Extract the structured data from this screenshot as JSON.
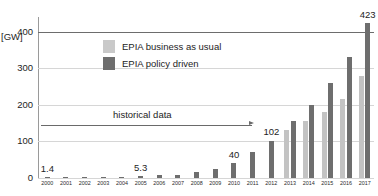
{
  "chart_data": {
    "type": "bar",
    "title": "",
    "xlabel": "",
    "ylabel": "[GW]",
    "ylim": [
      0,
      440
    ],
    "yticks": [
      0,
      100,
      200,
      300,
      400
    ],
    "grid": true,
    "legend_position": "inside-top-left",
    "categories": [
      "2000",
      "2001",
      "2002",
      "2003",
      "2004",
      "2005",
      "2006",
      "2007",
      "2008",
      "2009",
      "2010",
      "2011",
      "2012",
      "2013",
      "2014",
      "2015",
      "2016",
      "2017"
    ],
    "series": [
      {
        "name": "EPIA business as usual",
        "color": "#c3c3c3",
        "values": [
          null,
          null,
          null,
          null,
          null,
          null,
          null,
          null,
          null,
          null,
          null,
          null,
          null,
          130,
          155,
          180,
          215,
          280
        ]
      },
      {
        "name": "EPIA policy driven",
        "color": "#6e6e6e",
        "values": [
          1.4,
          1.8,
          2.2,
          2.8,
          3.9,
          5.3,
          7.0,
          9.5,
          16,
          24,
          40,
          70,
          102,
          155,
          200,
          260,
          330,
          423
        ]
      }
    ],
    "data_labels": [
      {
        "text": "1.4",
        "category": "2000"
      },
      {
        "text": "5.3",
        "category": "2005"
      },
      {
        "text": "40",
        "category": "2010"
      },
      {
        "text": "102",
        "category": "2012"
      },
      {
        "text": "423",
        "category": "2017"
      }
    ],
    "annotations": [
      {
        "text": "historical data",
        "type": "arrow",
        "from_category": "2000",
        "to_category": "2012"
      }
    ]
  },
  "legend": {
    "items": [
      {
        "label": "EPIA business as usual",
        "swatch": "bau"
      },
      {
        "label": "EPIA policy driven",
        "swatch": "pol"
      }
    ]
  },
  "axis": {
    "y_unit": "[GW]",
    "y_tick_labels": [
      "400",
      "300",
      "200",
      "100",
      "0"
    ]
  }
}
